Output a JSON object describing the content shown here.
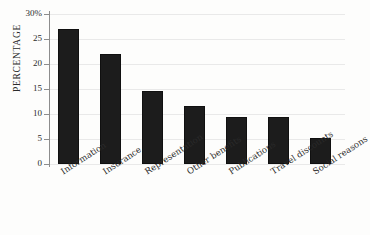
{
  "chart_data": {
    "type": "bar",
    "title": "",
    "xlabel": "",
    "ylabel": "PERCENTAGE",
    "ylim": [
      0,
      30
    ],
    "ytick_labels": [
      "30%",
      "25",
      "20",
      "15",
      "10",
      "5",
      "0"
    ],
    "ytick_values": [
      30,
      25,
      20,
      15,
      10,
      5,
      0
    ],
    "grid": true,
    "legend": "none",
    "bar_color": "#1c1c1c",
    "gridline_color": "#e9e9e9",
    "axis_color": "#8d8d8d",
    "background_color": "#fdfdfc",
    "categories": [
      "Information",
      "Insurance",
      "Representation",
      "Other benefits",
      "Publications",
      "Travel discounts",
      "Social reasons"
    ],
    "values": [
      27,
      22,
      14.7,
      11.6,
      9.5,
      9.4,
      5.3
    ]
  },
  "footer": {
    "caption_fragment": ""
  }
}
